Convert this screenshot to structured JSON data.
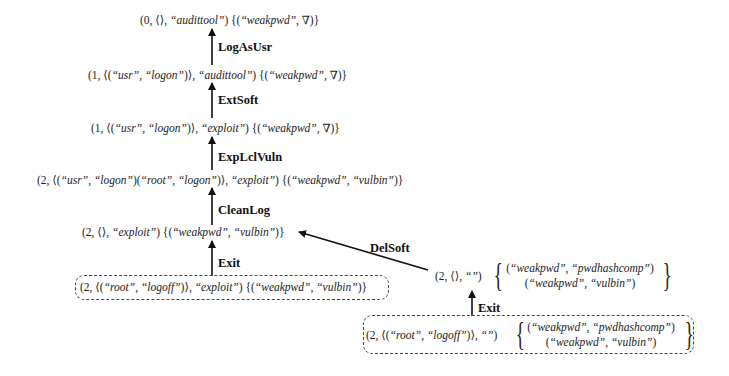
{
  "figure": {
    "nodes": {
      "n0": {
        "seg": [
          {
            "t": "(0, ⟨⟩, "
          },
          {
            "t": "“audittool”"
          },
          {
            "t": ") {("
          },
          {
            "t": "“weakpwd”"
          },
          {
            "t": ", ∇)}"
          }
        ]
      },
      "n1": {
        "seg": [
          {
            "t": "(1, ⟨("
          },
          {
            "t": "“usr”"
          },
          {
            "t": ", "
          },
          {
            "t": "“logon”"
          },
          {
            "t": ")⟩, "
          },
          {
            "t": "“audittool”"
          },
          {
            "t": ") {("
          },
          {
            "t": "“weakpwd”"
          },
          {
            "t": ", ∇)}"
          }
        ]
      },
      "n2": {
        "seg": [
          {
            "t": "(1, ⟨("
          },
          {
            "t": "“usr”"
          },
          {
            "t": ", "
          },
          {
            "t": "“logon”"
          },
          {
            "t": ")⟩, "
          },
          {
            "t": "“exploit”"
          },
          {
            "t": ") {("
          },
          {
            "t": "“weakpwd”"
          },
          {
            "t": ", ∇)}"
          }
        ]
      },
      "n3": {
        "seg": [
          {
            "t": "(2, ⟨("
          },
          {
            "t": "“usr”"
          },
          {
            "t": ", "
          },
          {
            "t": "“logon”"
          },
          {
            "t": ")("
          },
          {
            "t": "“root”"
          },
          {
            "t": ", "
          },
          {
            "t": "“logon”"
          },
          {
            "t": ")⟩, "
          },
          {
            "t": "“exploit”"
          },
          {
            "t": ") {("
          },
          {
            "t": "“weakpwd”"
          },
          {
            "t": ", "
          },
          {
            "t": "“vulbin”"
          },
          {
            "t": ")}"
          }
        ]
      },
      "n4": {
        "seg": [
          {
            "t": "(2, ⟨⟩, "
          },
          {
            "t": "“exploit”"
          },
          {
            "t": ") {("
          },
          {
            "t": "“weakpwd”"
          },
          {
            "t": ", "
          },
          {
            "t": "“vulbin”"
          },
          {
            "t": ")}"
          }
        ]
      },
      "n5": {
        "seg": [
          {
            "t": "(2, ⟨("
          },
          {
            "t": "“root”"
          },
          {
            "t": ", "
          },
          {
            "t": "“logoff”"
          },
          {
            "t": ")⟩, "
          },
          {
            "t": "“exploit”"
          },
          {
            "t": ") {("
          },
          {
            "t": "“weakpwd”"
          },
          {
            "t": ", "
          },
          {
            "t": "“vulbin”"
          },
          {
            "t": ")}"
          }
        ]
      },
      "n6": {
        "prefix": [
          {
            "t": "(2, ⟨⟩, "
          },
          {
            "t": "“”"
          },
          {
            "t": ")"
          }
        ],
        "brace_open": "{",
        "brace_close": "}",
        "set": [
          [
            {
              "t": "("
            },
            {
              "t": "“weakpwd”"
            },
            {
              "t": ", "
            },
            {
              "t": "“pwdhashcomp”"
            },
            {
              "t": ")"
            }
          ],
          [
            {
              "t": "("
            },
            {
              "t": "“weakpwd”"
            },
            {
              "t": ", "
            },
            {
              "t": "“vulbin”"
            },
            {
              "t": ")"
            }
          ]
        ]
      },
      "n7": {
        "prefix": [
          {
            "t": "(2, ⟨("
          },
          {
            "t": "“root”"
          },
          {
            "t": ", "
          },
          {
            "t": "“logoff”"
          },
          {
            "t": ")⟩, "
          },
          {
            "t": "“”"
          },
          {
            "t": ")"
          }
        ],
        "brace_open": "{",
        "brace_close": "}",
        "set": [
          [
            {
              "t": "("
            },
            {
              "t": "“weakpwd”"
            },
            {
              "t": ", "
            },
            {
              "t": "“pwdhashcomp”"
            },
            {
              "t": ")"
            }
          ],
          [
            {
              "t": "("
            },
            {
              "t": "“weakpwd”"
            },
            {
              "t": ", "
            },
            {
              "t": "“vulbin”"
            },
            {
              "t": ")"
            }
          ]
        ]
      }
    },
    "edges": [
      {
        "label": "LogAsUsr",
        "from": "n1",
        "to": "n0"
      },
      {
        "label": "ExtSoft",
        "from": "n2",
        "to": "n1"
      },
      {
        "label": "ExpLclVuln",
        "from": "n3",
        "to": "n2"
      },
      {
        "label": "CleanLog",
        "from": "n4",
        "to": "n3"
      },
      {
        "label": "Exit",
        "from": "n5",
        "to": "n4"
      },
      {
        "label": "DelSoft",
        "from": "n6",
        "to": "n4"
      },
      {
        "label": "Exit",
        "from": "n7",
        "to": "n6"
      }
    ],
    "initial_states": [
      "n5",
      "n7"
    ],
    "colors": {
      "text": "#1c1c1c",
      "arrow": "#111111",
      "box_border": "#444444",
      "background": "#ffffff"
    }
  }
}
